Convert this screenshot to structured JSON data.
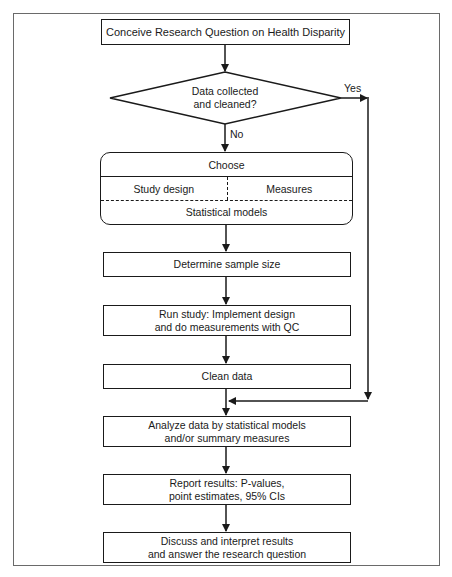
{
  "diagram": {
    "type": "flowchart",
    "start": {
      "label": "Conceive Research Question on Health Disparity"
    },
    "decision": {
      "line1": "Data collected",
      "line2": "and cleaned?",
      "yes_label": "Yes",
      "no_label": "No"
    },
    "choose": {
      "title": "Choose",
      "left": "Study design",
      "right": "Measures",
      "bottom": "Statistical models"
    },
    "steps": [
      {
        "line1": "Determine sample size",
        "line2": ""
      },
      {
        "line1": "Run study: Implement design",
        "line2": "and do measurements with QC"
      },
      {
        "line1": "Clean data",
        "line2": ""
      },
      {
        "line1": "Analyze data by statistical models",
        "line2": "and/or summary measures"
      },
      {
        "line1": "Report results: P-values,",
        "line2": "point estimates, 95% CIs"
      },
      {
        "line1": "Discuss and interpret results",
        "line2": "and answer the research question"
      }
    ],
    "colors": {
      "stroke": "#1a1a1a",
      "frame": "#6a6a6a",
      "background": "#ffffff"
    }
  }
}
